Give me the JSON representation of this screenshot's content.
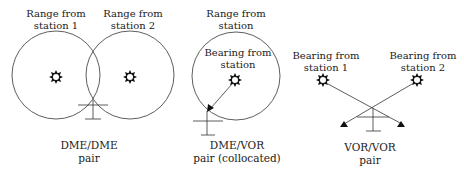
{
  "colors": {
    "line": "#333333",
    "text": "#222222",
    "background": "#ffffff"
  },
  "panels": [
    {
      "id": "dme-dme",
      "caption": [
        "DME/DME",
        "pair"
      ],
      "labels": [
        {
          "line1": "Range from",
          "line2": "station 1"
        },
        {
          "line1": "Range from",
          "line2": "station 2"
        }
      ],
      "stations": [
        "station-1",
        "station-2"
      ]
    },
    {
      "id": "dme-vor",
      "caption": [
        "DME/VOR",
        "pair (collocated)"
      ],
      "labels": [
        {
          "line1": "Range from",
          "line2": "station"
        },
        {
          "line1": "Bearing from",
          "line2": "station"
        }
      ],
      "stations": [
        "station"
      ]
    },
    {
      "id": "vor-vor",
      "caption": [
        "VOR/VOR",
        "pair"
      ],
      "labels": [
        {
          "line1": "Bearing from",
          "line2": "station 1"
        },
        {
          "line1": "Bearing from",
          "line2": "station 2"
        }
      ],
      "stations": [
        "station-1",
        "station-2"
      ]
    }
  ],
  "icons": {
    "station": "navaid-station-icon (gear/star glyph)",
    "aircraft": "aircraft-position-marker (inverted T)"
  }
}
